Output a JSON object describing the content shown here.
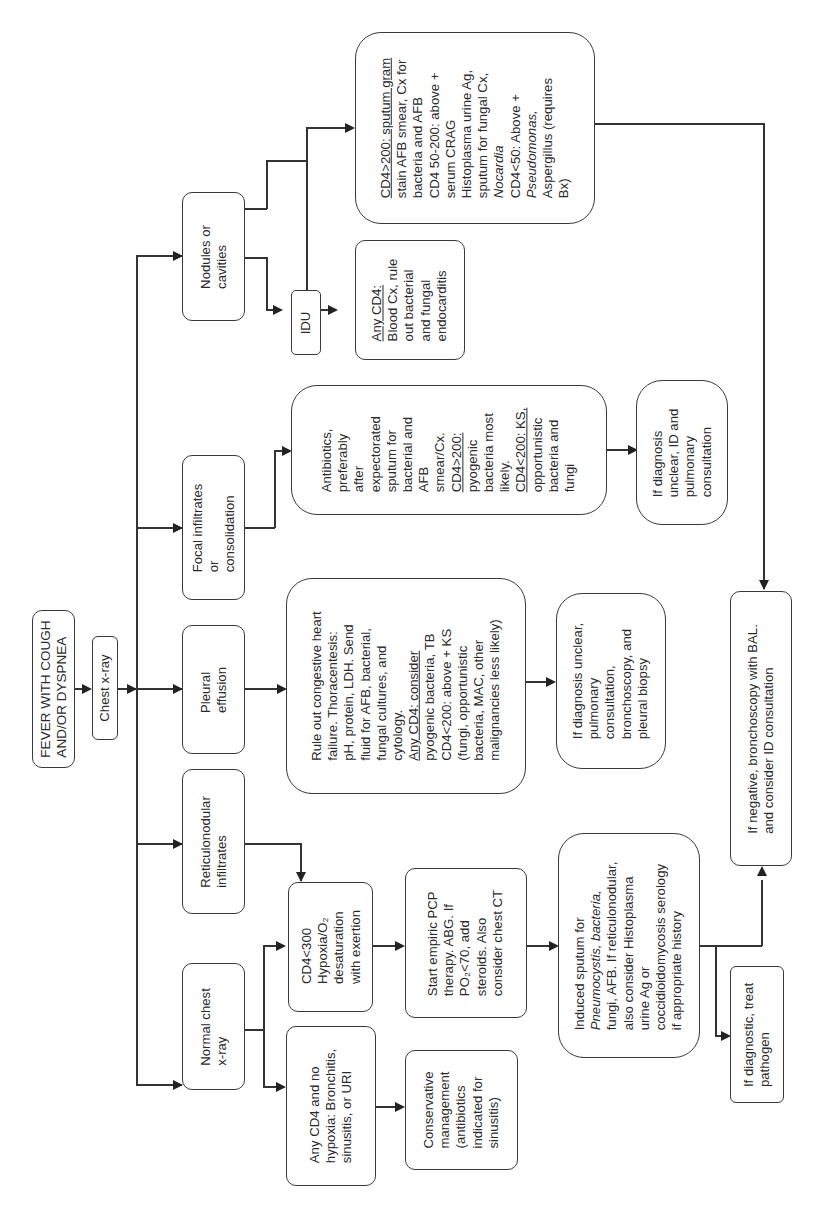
{
  "diagram": {
    "orientation": "rotated-90-ccw",
    "start": {
      "lines": [
        "FEVER WITH COUGH",
        "AND/OR DYSPNEA"
      ]
    },
    "chest_xray": {
      "lines": [
        "Chest x-ray"
      ]
    },
    "branches": [
      {
        "id": "normal",
        "lines": [
          "Normal chest",
          "x-ray"
        ]
      },
      {
        "id": "reticulonodular",
        "lines": [
          "Reticulonodular",
          "infiltrates"
        ]
      },
      {
        "id": "pleural",
        "lines": [
          "Pleural",
          "effusion"
        ]
      },
      {
        "id": "focal",
        "lines": [
          "Focal infiltrates",
          "or",
          "consolidation"
        ]
      },
      {
        "id": "nodules",
        "lines": [
          "Nodules or",
          "cavities"
        ]
      }
    ],
    "normal_no_hypoxia": {
      "lines": [
        "Any CD4 and no",
        "hypoxia: Bronchitis,",
        "sinusitis, or URI"
      ]
    },
    "conservative": {
      "lines": [
        "Conservative",
        "management",
        "(antibiotics",
        "indicated for",
        "sinusitis)"
      ]
    },
    "cd4_hypoxia": {
      "lines": [
        "CD4<300",
        "Hypoxia/O₂",
        "desaturation",
        "with exertion"
      ]
    },
    "pcp_therapy": {
      "lines": [
        "Start empiric PCP",
        "therapy. ABG. If",
        "PO₂<70, add",
        "steroids. Also",
        "consider chest CT"
      ]
    },
    "induced_sputum": {
      "lines": [
        "Induced sputum for",
        "Pneumocystis, bacteria,",
        "fungi, AFB. If reticulonodular,",
        "also consider Histoplasma",
        "urine Ag or",
        "coccidioidomycosis serology",
        "if appropriate history"
      ]
    },
    "if_diagnostic": {
      "lines": [
        "If diagnostic, treat",
        "pathogen"
      ]
    },
    "if_negative": {
      "lines": [
        "If negative, bronchoscopy with BAL.",
        "and consider ID consultation"
      ]
    },
    "pleural_workup": {
      "lines": [
        "Rule out congestive heart",
        "failure. Thoracentesis:",
        "pH, protein, LDH. Send",
        "fluid for AFB, bacterial,",
        "fungal cultures, and",
        "cytology.",
        "Any CD4: consider",
        "pyogenic bacteria, TB",
        "CD4<200: above + KS",
        "(fungi, opportunistic",
        "bacteria, MAC, other",
        "malignancies less likely)"
      ]
    },
    "pleural_unclear": {
      "lines": [
        "If diagnosis unclear,",
        "pulmonary",
        "consultation,",
        "bronchoscopy, and",
        "pleural biopsy"
      ]
    },
    "focal_workup": {
      "lines": [
        "Antibiotics,",
        "preferably",
        "after",
        "expectorated",
        "sputum for",
        "bacterial and",
        "AFB",
        "smear/Cx.",
        "CD4>200:",
        "pyogenic",
        "bacteria most",
        "likely.",
        "CD4<200: KS,",
        "opportunistic",
        "bacteria and",
        "fungi"
      ]
    },
    "focal_unclear": {
      "lines": [
        "If diagnosis",
        "unclear, ID and",
        "pulmonary",
        "consultation"
      ]
    },
    "idu": {
      "lines": [
        "IDU"
      ]
    },
    "idu_workup": {
      "lines": [
        "Any CD4:",
        "Blood Cx, rule",
        "out bacterial",
        "and fungal",
        "endocarditis"
      ]
    },
    "nodules_workup": {
      "lines": [
        "CD4>200: sputum gram",
        "stain AFB smear, Cx for",
        "bacteria and AFB",
        "CD4 50-200: above +",
        "serum CRAG",
        "Histoplasma urine Ag,",
        "sputum for fungal Cx,",
        "Nocardia",
        "CD4<50: Above +",
        "Pseudomonas,",
        "Aspergillus (requires",
        "Bx)"
      ]
    }
  }
}
